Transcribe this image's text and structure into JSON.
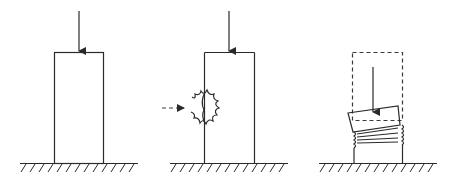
{
  "diagram": {
    "panels": [
      {
        "id": "intact",
        "label": "",
        "elements": [
          "axial-load-arrow",
          "column",
          "ground"
        ]
      },
      {
        "id": "impact",
        "label": "",
        "elements": [
          "axial-load-arrow",
          "column",
          "lateral-impact-arrow",
          "damage-burst",
          "ground"
        ]
      },
      {
        "id": "collapse",
        "label": "",
        "elements": [
          "original-outline-dashed",
          "axial-load-arrow",
          "tilted-top-block",
          "crumpled-section",
          "column-stub",
          "ground"
        ]
      }
    ],
    "colors": {
      "line": "#2a2a2a",
      "background": "#ffffff"
    }
  }
}
